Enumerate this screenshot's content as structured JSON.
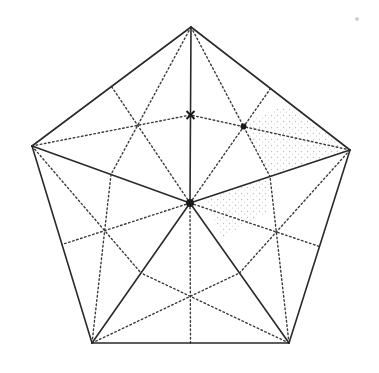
{
  "diagram": {
    "width": 379,
    "height": 373,
    "colors": {
      "stroke": "#2a2a2a",
      "dotted": "#3a3a3a",
      "shading": "#bdbdbd",
      "background": "#ffffff"
    },
    "vertices": {
      "T": [
        191,
        27
      ],
      "R": [
        350,
        150
      ],
      "BR": [
        289,
        343
      ],
      "BL": [
        92,
        343
      ],
      "L": [
        32,
        146
      ],
      "C": [
        190,
        203
      ]
    },
    "solid_edges": [
      [
        "T",
        "R"
      ],
      [
        "R",
        "BR"
      ],
      [
        "BR",
        "BL"
      ],
      [
        "BL",
        "L"
      ],
      [
        "L",
        "T"
      ],
      [
        "C",
        "T"
      ],
      [
        "C",
        "R"
      ],
      [
        "C",
        "BR"
      ],
      [
        "C",
        "BL"
      ],
      [
        "C",
        "L"
      ]
    ],
    "dotted_medians": [
      [
        [
          190,
          203
        ],
        [
          270.5,
          88.5
        ]
      ],
      [
        [
          191,
          27
        ],
        [
          270,
          176.5
        ]
      ],
      [
        [
          350,
          150
        ],
        [
          190.5,
          115
        ]
      ],
      [
        [
          190,
          203
        ],
        [
          319.5,
          246.5
        ]
      ],
      [
        [
          350,
          150
        ],
        [
          239.5,
          273
        ]
      ],
      [
        [
          289,
          343
        ],
        [
          270,
          176.5
        ]
      ],
      [
        [
          190,
          203
        ],
        [
          190.5,
          343
        ]
      ],
      [
        [
          289,
          343
        ],
        [
          141,
          273
        ]
      ],
      [
        [
          92,
          343
        ],
        [
          239.5,
          273
        ]
      ],
      [
        [
          190,
          203
        ],
        [
          62,
          244.5
        ]
      ],
      [
        [
          92,
          343
        ],
        [
          111,
          174.5
        ]
      ],
      [
        [
          32,
          146
        ],
        [
          141,
          273
        ]
      ],
      [
        [
          190,
          203
        ],
        [
          111.5,
          86.5
        ]
      ],
      [
        [
          32,
          146
        ],
        [
          190.5,
          115
        ]
      ],
      [
        [
          191,
          27
        ],
        [
          111,
          174.5
        ]
      ]
    ],
    "markers": [
      {
        "name": "center-point",
        "type": "filled-circle",
        "at": [
          190,
          203
        ],
        "r": 4
      },
      {
        "name": "midpoint-cross",
        "type": "cross",
        "at": [
          190.5,
          115
        ],
        "size": 4
      },
      {
        "name": "centroid-dot",
        "type": "filled-circle",
        "at": [
          243.5,
          126.5
        ],
        "r": 3
      },
      {
        "name": "stray-speck",
        "type": "faint-dot",
        "at": [
          357,
          19
        ],
        "r": 2
      }
    ],
    "shaded_regions": [
      [
        [
          246,
          122
        ],
        [
          285,
          105
        ],
        [
          350,
          150
        ],
        [
          270,
          176.5
        ],
        [
          250,
          145
        ]
      ],
      [
        [
          205,
          200
        ],
        [
          270,
          176.5
        ],
        [
          268,
          212
        ],
        [
          222,
          238
        ]
      ]
    ]
  }
}
